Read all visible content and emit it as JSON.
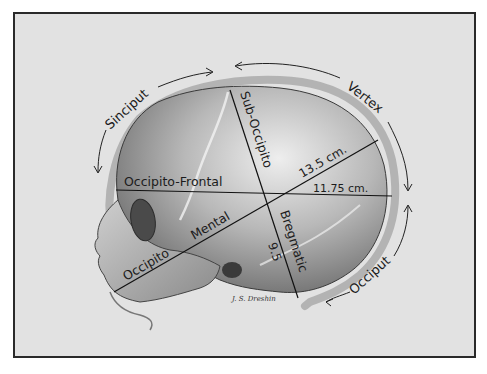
{
  "figure": {
    "regions": {
      "sinciput": "Sinciput",
      "vertex": "Vertex",
      "occiput": "Occiput"
    },
    "diameters": {
      "occipito_frontal": {
        "label": "Occipito-Frontal",
        "value": "11.75 cm."
      },
      "occipito_mental": {
        "label_part1": "Occipito",
        "label_part2": "Mental",
        "value": "13.5 cm."
      },
      "sub_occipito_bregmatic": {
        "label_part1": "Sub-Occipito",
        "label_part2": "Bregmatic",
        "value": "9.5"
      }
    },
    "signature": "J. S. Dreshin"
  },
  "colors": {
    "paper": "#e2e2e2",
    "frame": "#2a2a2a",
    "skull_light": "#d9d9d9",
    "skull_dark": "#6a6a6a",
    "ink": "#1c1c1c"
  }
}
